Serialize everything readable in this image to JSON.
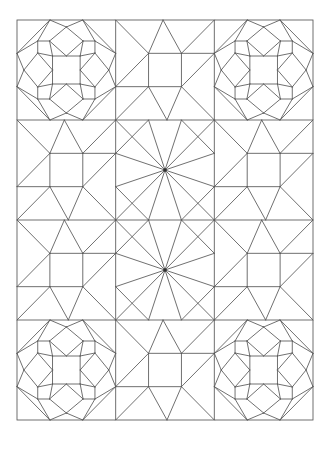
{
  "pattern": {
    "canvas": {
      "width": 330,
      "height": 449
    },
    "background": "#ffffff",
    "stroke": {
      "color": "#565656",
      "width": 0.85
    },
    "frame": {
      "x": 17,
      "y": 20,
      "width": 296,
      "height": 400
    },
    "grid": {
      "columns": 3,
      "rows": 4,
      "column_xs": [
        17,
        115.67,
        214.33,
        313
      ],
      "row_ys": [
        20,
        120,
        220,
        320,
        420
      ]
    },
    "layout": [
      [
        "octagon-star",
        "windblown-square",
        "octagon-star"
      ],
      [
        "windblown-square",
        "kaleidoscope-burst",
        "windblown-square"
      ],
      [
        "windblown-square",
        "kaleidoscope-burst",
        "windblown-square"
      ],
      [
        "octagon-star",
        "windblown-square",
        "octagon-star"
      ]
    ],
    "blocks": {
      "octagon-star": {
        "segments": [
          [
            0,
            0.3333,
            0.3333,
            0
          ],
          [
            0.6667,
            0,
            1,
            0.3333
          ],
          [
            1,
            0.6667,
            0.6667,
            1
          ],
          [
            0.3333,
            1,
            0,
            0.6667
          ],
          [
            0.21,
            0.21,
            0.3333,
            0
          ],
          [
            0.21,
            0.21,
            0,
            0.3333
          ],
          [
            0.79,
            0.21,
            0.6667,
            0
          ],
          [
            0.79,
            0.21,
            1,
            0.3333
          ],
          [
            0.79,
            0.79,
            1,
            0.6667
          ],
          [
            0.79,
            0.79,
            0.6667,
            1
          ],
          [
            0.21,
            0.79,
            0.3333,
            1
          ],
          [
            0.21,
            0.79,
            0,
            0.6667
          ],
          [
            0.36,
            0.36,
            0.64,
            0.36
          ],
          [
            0.64,
            0.36,
            0.64,
            0.64
          ],
          [
            0.64,
            0.64,
            0.36,
            0.64
          ],
          [
            0.36,
            0.64,
            0.36,
            0.36
          ],
          [
            0.5,
            0.07,
            0.67,
            0.21
          ],
          [
            0.67,
            0.21,
            0.5,
            0.36
          ],
          [
            0.5,
            0.36,
            0.33,
            0.21
          ],
          [
            0.33,
            0.21,
            0.5,
            0.07
          ],
          [
            0.93,
            0.5,
            0.79,
            0.67
          ],
          [
            0.79,
            0.67,
            0.64,
            0.5
          ],
          [
            0.64,
            0.5,
            0.79,
            0.33
          ],
          [
            0.79,
            0.33,
            0.93,
            0.5
          ],
          [
            0.5,
            0.93,
            0.33,
            0.79
          ],
          [
            0.33,
            0.79,
            0.5,
            0.64
          ],
          [
            0.5,
            0.64,
            0.67,
            0.79
          ],
          [
            0.67,
            0.79,
            0.5,
            0.93
          ],
          [
            0.07,
            0.5,
            0.21,
            0.33
          ],
          [
            0.21,
            0.33,
            0.36,
            0.5
          ],
          [
            0.36,
            0.5,
            0.21,
            0.67
          ],
          [
            0.21,
            0.67,
            0.07,
            0.5
          ],
          [
            0.3333,
            0,
            0.5,
            0.07
          ],
          [
            0.6667,
            0,
            0.5,
            0.07
          ],
          [
            1,
            0.3333,
            0.93,
            0.5
          ],
          [
            1,
            0.6667,
            0.93,
            0.5
          ],
          [
            0.3333,
            1,
            0.5,
            0.93
          ],
          [
            0.6667,
            1,
            0.5,
            0.93
          ],
          [
            0,
            0.3333,
            0.07,
            0.5
          ],
          [
            0,
            0.6667,
            0.07,
            0.5
          ],
          [
            0.21,
            0.21,
            0.33,
            0.21
          ],
          [
            0.21,
            0.21,
            0.21,
            0.33
          ],
          [
            0.79,
            0.21,
            0.67,
            0.21
          ],
          [
            0.79,
            0.21,
            0.79,
            0.33
          ],
          [
            0.79,
            0.79,
            0.67,
            0.79
          ],
          [
            0.79,
            0.79,
            0.79,
            0.67
          ],
          [
            0.21,
            0.79,
            0.33,
            0.79
          ],
          [
            0.21,
            0.79,
            0.21,
            0.67
          ],
          [
            0.33,
            0.21,
            0.36,
            0.36
          ],
          [
            0.21,
            0.33,
            0.36,
            0.36
          ],
          [
            0.67,
            0.21,
            0.64,
            0.36
          ],
          [
            0.79,
            0.33,
            0.64,
            0.36
          ],
          [
            0.79,
            0.67,
            0.64,
            0.64
          ],
          [
            0.67,
            0.79,
            0.64,
            0.64
          ],
          [
            0.33,
            0.79,
            0.36,
            0.64
          ],
          [
            0.21,
            0.67,
            0.36,
            0.64
          ]
        ]
      },
      "windblown-square": {
        "segments": [
          [
            0.3333,
            0.3333,
            0.6667,
            0.3333
          ],
          [
            0.6667,
            0.3333,
            0.6667,
            0.6667
          ],
          [
            0.6667,
            0.6667,
            0.3333,
            0.6667
          ],
          [
            0.3333,
            0.6667,
            0.3333,
            0.3333
          ],
          [
            0,
            0,
            0.3333,
            0.3333
          ],
          [
            1,
            0,
            0.6667,
            0.3333
          ],
          [
            1,
            1,
            0.6667,
            0.6667
          ],
          [
            0,
            1,
            0.3333,
            0.6667
          ],
          [
            0.48,
            0,
            0.3333,
            0.3333
          ],
          [
            0.48,
            0,
            0.6667,
            0.3333
          ],
          [
            1,
            0.3333,
            0.6667,
            0.3333
          ],
          [
            1,
            0.3333,
            0.6667,
            0.6667
          ],
          [
            0.52,
            1,
            0.6667,
            0.6667
          ],
          [
            0.52,
            1,
            0.3333,
            0.6667
          ],
          [
            0,
            0.6667,
            0.3333,
            0.6667
          ],
          [
            0,
            0.6667,
            0.3333,
            0.3333
          ]
        ]
      },
      "kaleidoscope-burst": {
        "segments": [
          [
            0.5,
            0.5,
            0,
            0
          ],
          [
            0.5,
            0.5,
            0.3333,
            0
          ],
          [
            0.5,
            0.5,
            0.6667,
            0
          ],
          [
            0.5,
            0.5,
            1,
            0
          ],
          [
            0.5,
            0.5,
            1,
            0.3333
          ],
          [
            0.5,
            0.5,
            1,
            0.6667
          ],
          [
            0.5,
            0.5,
            1,
            1
          ],
          [
            0.5,
            0.5,
            0.6667,
            1
          ],
          [
            0.5,
            0.5,
            0.3333,
            1
          ],
          [
            0.5,
            0.5,
            0,
            1
          ],
          [
            0.5,
            0.5,
            0,
            0.6667
          ],
          [
            0.5,
            0.5,
            0,
            0.3333
          ],
          [
            0,
            0.3333,
            0.3333,
            0
          ],
          [
            0.6667,
            0,
            1,
            0.3333
          ],
          [
            1,
            0.6667,
            0.6667,
            1
          ],
          [
            0.3333,
            1,
            0,
            0.6667
          ]
        ],
        "center_dot": {
          "cx": 0.5,
          "cy": 0.5,
          "r": 1.7,
          "color": "#2e2e2e"
        }
      }
    }
  }
}
